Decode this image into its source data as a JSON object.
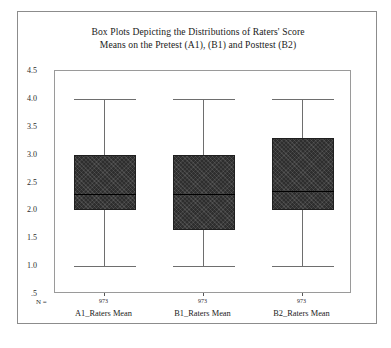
{
  "figure": {
    "title_line1": "Box Plots Depicting the Distributions of Raters' Score",
    "title_line2": "Means on the Pretest (A1), (B1) and Posttest (B2)",
    "n_axis_label": "N =",
    "frame_color": "#8c8c8c",
    "box_fill_color": "#2e2e2e",
    "whisker_color": "#6e6e6e",
    "median_color": "#000000",
    "background_color": "#ffffff"
  },
  "axis": {
    "y_ticks": [
      "4.5",
      "4.0",
      "3.5",
      "3.0",
      "2.5",
      "2.0",
      "1.5",
      "1.0",
      ".5"
    ],
    "y_min": 0.5,
    "y_max": 4.5
  },
  "chart_data": {
    "type": "box",
    "title": "Box Plots Depicting the Distributions of Raters' Score Means on the Pretest (A1), (B1) and Posttest (B2)",
    "xlabel": "",
    "ylabel": "",
    "ylim": [
      0.5,
      4.5
    ],
    "yticks": [
      0.5,
      1.0,
      1.5,
      2.0,
      2.5,
      3.0,
      3.5,
      4.0,
      4.5
    ],
    "grid": false,
    "legend": "none",
    "categories": [
      "A1_Raters Mean",
      "B1_Raters Mean",
      "B2_Raters Mean"
    ],
    "counts": [
      "973",
      "973",
      "973"
    ],
    "boxes": [
      {
        "label": "A1_Raters Mean",
        "n": "973",
        "whisker_low": 1.0,
        "q1": 2.0,
        "median": 2.3,
        "q3": 3.0,
        "whisker_high": 4.0
      },
      {
        "label": "B1_Raters Mean",
        "n": "973",
        "whisker_low": 1.0,
        "q1": 1.65,
        "median": 2.3,
        "q3": 3.0,
        "whisker_high": 4.0
      },
      {
        "label": "B2_Raters Mean",
        "n": "973",
        "whisker_low": 1.0,
        "q1": 2.0,
        "median": 2.35,
        "q3": 3.3,
        "whisker_high": 4.0
      }
    ]
  }
}
